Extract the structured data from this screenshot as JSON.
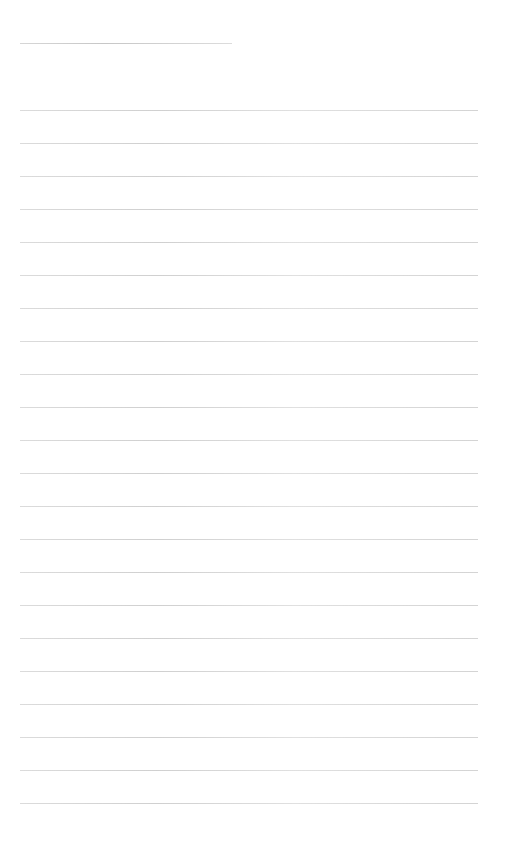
{
  "document": {
    "type": "lined-page",
    "header_line": {
      "x": 20,
      "y": 43,
      "width": 212
    },
    "rules": {
      "count": 22,
      "start_y": 110,
      "spacing": 33,
      "x": 20,
      "width": 458,
      "color": "#c8c8c8"
    },
    "text": ""
  }
}
